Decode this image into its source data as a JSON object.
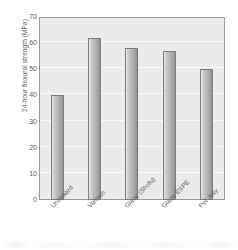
{
  "chart_data": {
    "type": "bar",
    "title": "",
    "subtitle": "",
    "xlabel": "",
    "ylabel": "24-hour flexural strength (MPa)",
    "categories": [
      "Untreated",
      "Varnish",
      "Glaze (Shofu)",
      "Glaze ESPE",
      "Pet Jelly"
    ],
    "values": [
      40,
      62,
      58,
      57,
      50
    ],
    "series": [
      {
        "name": "24-hour flexural strength",
        "values": [
          40,
          62,
          58,
          57,
          50
        ]
      }
    ],
    "ylim": [
      0,
      70
    ],
    "yticks": [
      0,
      10,
      20,
      30,
      40,
      50,
      60,
      70
    ],
    "ytick_labels": [
      "0",
      "10",
      "20",
      "30",
      "40",
      "50",
      "60",
      "70"
    ],
    "grid": true,
    "grid_axis": "y",
    "legend": false,
    "legend_position": "none",
    "units": "MPa",
    "colors": {
      "plot_background": "#ebebeb",
      "figure_background": "#ffffff",
      "bar_fill_light": "#e9e9e9",
      "bar_fill_mid": "#b0b0b0",
      "bar_fill_dark": "#8f8f8f",
      "bar_edge": "#7d7d7d",
      "gridline": "#fbfbfb",
      "axis_line": "#9a9a9a",
      "text": "#5d5d5d"
    }
  }
}
